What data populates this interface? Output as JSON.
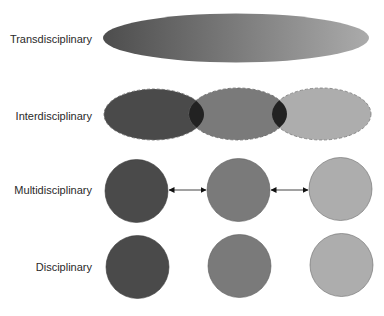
{
  "diagram": {
    "rows": [
      {
        "id": "transdisciplinary",
        "label": "Transdisciplinary"
      },
      {
        "id": "interdisciplinary",
        "label": "Interdisciplinary"
      },
      {
        "id": "multidisciplinary",
        "label": "Multidisciplinary"
      },
      {
        "id": "disciplinary",
        "label": "Disciplinary"
      }
    ],
    "colors": {
      "discipline_1": "#4a4a4a",
      "discipline_2": "#7a7a7a",
      "discipline_3": "#adadad",
      "overlap": "#222222",
      "gradient_start": "#4d4d4d",
      "gradient_mid": "#7b7b7b",
      "gradient_end": "#ababab",
      "arrow": "#111111"
    },
    "connections": [
      {
        "from": "discipline_1",
        "to": "discipline_2",
        "type": "bidirectional-arrow"
      },
      {
        "from": "discipline_2",
        "to": "discipline_3",
        "type": "bidirectional-arrow"
      }
    ]
  }
}
